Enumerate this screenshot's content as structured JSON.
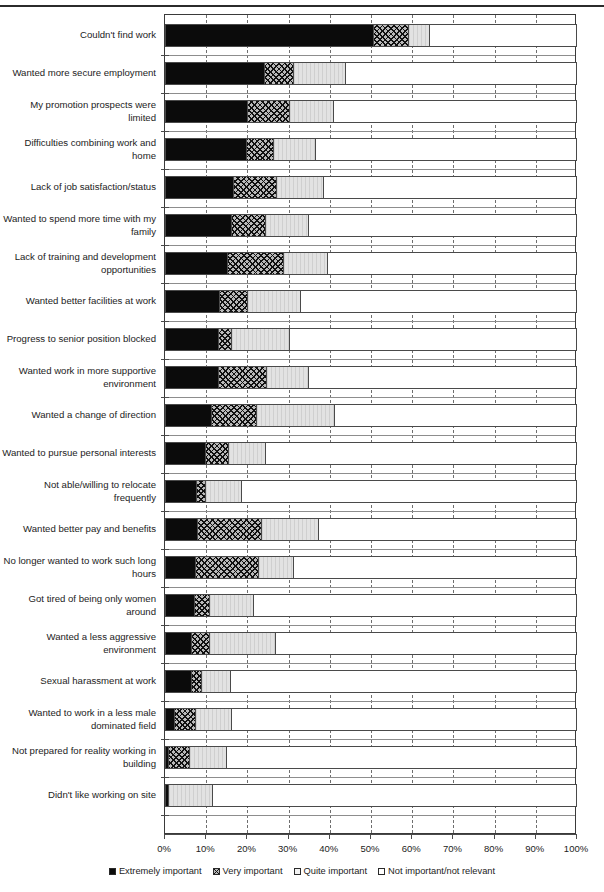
{
  "chart_data": {
    "type": "bar",
    "orientation": "horizontal",
    "stacked": true,
    "stack_total": 100,
    "title": "",
    "xlabel": "",
    "ylabel": "",
    "xlim": [
      0,
      100
    ],
    "grid": true,
    "legend_position": "bottom",
    "xticklabels": [
      "0%",
      "10%",
      "20%",
      "30%",
      "40%",
      "50%",
      "60%",
      "70%",
      "80%",
      "90%",
      "100%"
    ],
    "xtickvalues": [
      0,
      10,
      20,
      30,
      40,
      50,
      60,
      70,
      80,
      90,
      100
    ],
    "series": [
      {
        "name": "Extremely important",
        "swatch": "sw-1",
        "color": "#0b0b0b"
      },
      {
        "name": "Very important",
        "swatch": "sw-2",
        "color": "#b9b9b9"
      },
      {
        "name": "Quite important",
        "swatch": "sw-3",
        "color": "#e2e2e2"
      },
      {
        "name": "Not important/not relevant",
        "swatch": "sw-4",
        "color": "#ffffff"
      }
    ],
    "categories": [
      "Couldn't find work",
      "Wanted more secure employment",
      "My promotion prospects were limited",
      "Difficulties combining work and home",
      "Lack of job satisfaction/status",
      "Wanted to spend more time with my family",
      "Lack of training and development opportunities",
      "Wanted better facilities at work",
      "Progress to senior position blocked",
      "Wanted work in more supportive environment",
      "Wanted a change of direction",
      "Wanted to pursue personal interests",
      "Not able/willing to relocate frequently",
      "Wanted better pay and benefits",
      "No longer wanted to work such long hours",
      "Got tired of being only women around",
      "Wanted a less aggressive environment",
      "Sexual harassment at work",
      "Wanted to work in a less male dominated field",
      "Not prepared for reality working in building",
      "Didn't like working on site"
    ],
    "values": [
      [
        50.5,
        8.5,
        5.0,
        36.0
      ],
      [
        24.0,
        7.0,
        12.7,
        56.3
      ],
      [
        20.0,
        10.0,
        10.8,
        59.2
      ],
      [
        19.7,
        6.5,
        10.2,
        63.6
      ],
      [
        16.5,
        10.5,
        11.3,
        61.7
      ],
      [
        16.0,
        8.3,
        10.4,
        65.3
      ],
      [
        15.0,
        13.6,
        10.7,
        60.7
      ],
      [
        13.2,
        6.8,
        12.8,
        67.2
      ],
      [
        12.9,
        3.1,
        14.2,
        69.8
      ],
      [
        12.8,
        11.7,
        10.2,
        65.3
      ],
      [
        11.2,
        10.8,
        19.0,
        59.0
      ],
      [
        9.8,
        5.5,
        9.0,
        75.7
      ],
      [
        7.5,
        2.2,
        8.7,
        81.6
      ],
      [
        7.7,
        15.6,
        13.8,
        62.9
      ],
      [
        7.4,
        15.1,
        8.5,
        69.0
      ],
      [
        7.1,
        3.5,
        10.7,
        78.7
      ],
      [
        6.2,
        4.4,
        16.2,
        73.2
      ],
      [
        6.2,
        2.6,
        7.1,
        84.1
      ],
      [
        2.3,
        5.1,
        8.6,
        84.0
      ],
      [
        0.8,
        5.1,
        8.9,
        85.2
      ],
      [
        0.8,
        0.0,
        10.6,
        88.6
      ]
    ]
  },
  "legend": {
    "items": [
      "Extremely important",
      "Very important",
      "Quite important",
      "Not important/not relevant"
    ]
  }
}
